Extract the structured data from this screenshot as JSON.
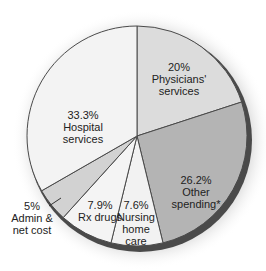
{
  "chart_data": {
    "type": "pie",
    "title": "",
    "start_angle_deg": 0,
    "direction": "clockwise",
    "slices": [
      {
        "label": "Physicians' services",
        "value": 20.0,
        "value_label": "20%",
        "lines": [
          "20%",
          "Physicians'",
          "services"
        ],
        "color": "#dcdcdc"
      },
      {
        "label": "Other spending*",
        "value": 26.2,
        "value_label": "26.2%",
        "lines": [
          "26.2%",
          "Other",
          "spending*"
        ],
        "color": "#b4b4b4"
      },
      {
        "label": "Nursing home care",
        "value": 7.6,
        "value_label": "7.6%",
        "lines": [
          "7.6%",
          "Nursing",
          "home",
          "care"
        ],
        "color": "#f2f2f2"
      },
      {
        "label": "Rx drugs",
        "value": 7.9,
        "value_label": "7.9%",
        "lines": [
          "7.9%",
          "Rx drugs"
        ],
        "color": "#f4f4f4"
      },
      {
        "label": "Admin & net cost",
        "value": 5.0,
        "value_label": "5%",
        "lines": [
          "5%",
          "Admin &",
          "net cost"
        ],
        "color": "#d2d2d2",
        "label_outside": true
      },
      {
        "label": "Hospital services",
        "value": 33.3,
        "value_label": "33.3%",
        "lines": [
          "33.3%",
          "Hospital",
          "services"
        ],
        "color": "#f3f3f3"
      }
    ],
    "legend": "none"
  }
}
